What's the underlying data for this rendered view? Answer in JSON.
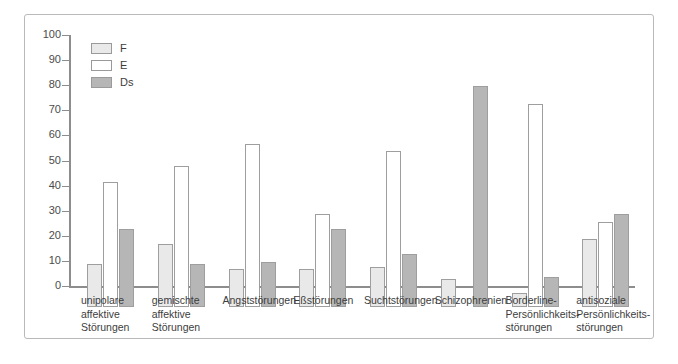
{
  "chart_data": {
    "type": "bar",
    "title": "",
    "xlabel": "",
    "ylabel": "",
    "ylim": [
      0,
      100
    ],
    "ytick_step": 10,
    "yticks": [
      0,
      10,
      20,
      30,
      40,
      50,
      60,
      70,
      80,
      90,
      100
    ],
    "grid": false,
    "legend_position": "top-left",
    "categories": [
      "unipolare\naffektive\nStörungen",
      "gemischte\naffektive\nStörungen",
      "Angststörungen",
      "Eßstörungen",
      "Suchtstörungen",
      "Schizophrenien",
      "Borderline-\nPersönlichkeits-\nstörungen",
      "antisoziale\nPersönlichkeits-\nstörungen"
    ],
    "series": [
      {
        "name": "F",
        "color": "#e9e9e9",
        "values": [
          17,
          25,
          15,
          15,
          16,
          11,
          5.5,
          27
        ]
      },
      {
        "name": "E",
        "color": "#ffffff",
        "values": [
          50,
          56,
          65,
          37,
          62,
          null,
          81,
          34
        ]
      },
      {
        "name": "Ds",
        "color": "#b6b6b6",
        "values": [
          31,
          17,
          18,
          31,
          21,
          88,
          12,
          37
        ]
      }
    ]
  },
  "legend": {
    "items": [
      {
        "label": "F",
        "color": "#e9e9e9"
      },
      {
        "label": "E",
        "color": "#ffffff"
      },
      {
        "label": "Ds",
        "color": "#b6b6b6"
      }
    ]
  },
  "axis": {
    "y_tick_labels": [
      "100",
      "90",
      "80",
      "70",
      "60",
      "50",
      "40",
      "30",
      "20",
      "10",
      "0"
    ]
  },
  "colors": {
    "frame": "#b9b9b9",
    "axis": "#8d8d8d",
    "bar_outline": "#9e9e9e",
    "text": "#3d3d3d"
  }
}
